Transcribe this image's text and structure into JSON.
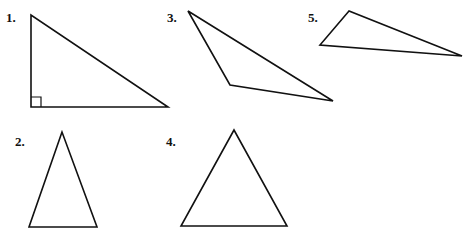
{
  "figures": [
    {
      "label": "1.",
      "type": "right triangle",
      "points": "31,15 31,107 168,107",
      "label_pos": [
        6,
        22
      ],
      "right_angle_marker": true
    },
    {
      "label": "3.",
      "type": "obtuse triangle",
      "points": "188,11 230,85 333,101",
      "label_pos": [
        167,
        22
      ]
    },
    {
      "label": "5.",
      "type": "obtuse triangle",
      "points": "349,11 320,45 462,56",
      "label_pos": [
        308,
        22
      ]
    },
    {
      "label": "2.",
      "type": "isosceles triangle",
      "points": "62,132 29,227 97,227",
      "label_pos": [
        15,
        146
      ]
    },
    {
      "label": "4.",
      "type": "equilateral triangle",
      "points": "234,130 181,226 287,226",
      "label_pos": [
        166,
        146
      ]
    }
  ]
}
